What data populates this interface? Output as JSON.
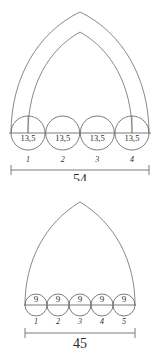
{
  "figures": [
    {
      "id": "upper-arch-figure",
      "arch_type": "double-pointed-arch",
      "circles": [
        {
          "label": "13,5",
          "index": "1"
        },
        {
          "label": "13,5",
          "index": "2"
        },
        {
          "label": "13,5",
          "index": "3"
        },
        {
          "label": "13,5",
          "index": "4"
        }
      ],
      "total_dimension": "54"
    },
    {
      "id": "lower-arch-figure",
      "arch_type": "single-pointed-arch",
      "circles": [
        {
          "label": "9",
          "index": "1"
        },
        {
          "label": "9",
          "index": "2"
        },
        {
          "label": "9",
          "index": "3"
        },
        {
          "label": "9",
          "index": "4"
        },
        {
          "label": "9",
          "index": "5"
        }
      ],
      "total_dimension": "45"
    }
  ],
  "colors": {
    "line": "#6b6b6b",
    "text": "#2b2b2b",
    "background": "#ffffff"
  }
}
